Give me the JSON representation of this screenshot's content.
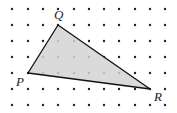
{
  "diagram": {
    "type": "dot-grid-triangle",
    "grid": {
      "columns_x": [
        12,
        28,
        43,
        58,
        74,
        89,
        104,
        119,
        135,
        150,
        165
      ],
      "rows_y": [
        9,
        25,
        41,
        57,
        73,
        89,
        105
      ],
      "dot_color": "#222222"
    },
    "triangle": {
      "fill": "#d4d4d4",
      "stroke": "#111111",
      "vertices": {
        "P": {
          "x": 28,
          "y": 73
        },
        "Q": {
          "x": 58,
          "y": 25
        },
        "R": {
          "x": 150,
          "y": 89
        }
      }
    },
    "labels": {
      "P": "P",
      "Q": "Q",
      "R": "R"
    }
  }
}
